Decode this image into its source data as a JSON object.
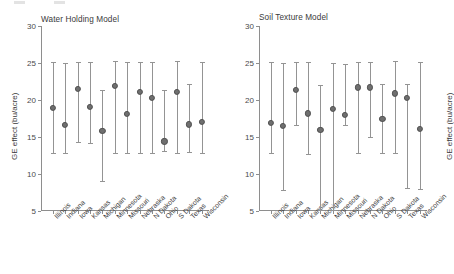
{
  "figure": {
    "panels": [
      {
        "id": "water-holding",
        "title": "Water Holding Model",
        "ylabel": "GE effect (bu/acre)"
      },
      {
        "id": "soil-texture",
        "title": "Soil Texture Model",
        "ylabel": "GE effect (bu/acre)"
      }
    ]
  },
  "chart_data": [
    {
      "type": "scatter",
      "title": "Water Holding Model",
      "xlabel": "",
      "ylabel": "GE effect (bu/acre)",
      "ylim": [
        5,
        30
      ],
      "yticks": [
        30,
        25,
        20,
        15,
        10,
        5
      ],
      "grid": false,
      "legend": "none",
      "categories": [
        "Illinois",
        "Indiana",
        "Iowa",
        "Kansas",
        "Michigan",
        "Minnesota",
        "Missouri",
        "Nebraska",
        "N Dakota",
        "Ohio",
        "S Dakota",
        "Texas",
        "Wisconsin"
      ],
      "values": [
        18.9,
        16.6,
        21.5,
        19.1,
        15.8,
        21.9,
        18.1,
        21.1,
        20.3,
        14.4,
        21.1,
        16.7,
        17.0
      ],
      "ci_lower": [
        12.8,
        12.8,
        14.3,
        14.2,
        9.1,
        12.8,
        12.8,
        12.8,
        12.9,
        13.1,
        12.9,
        13.0,
        12.8
      ],
      "ci_upper": [
        25.1,
        25.0,
        25.2,
        25.1,
        21.3,
        25.3,
        25.1,
        25.2,
        25.1,
        21.3,
        25.3,
        22.2,
        25.2
      ]
    },
    {
      "type": "scatter",
      "title": "Soil Texture Model",
      "xlabel": "",
      "ylabel": "GE effect (bu/acre)",
      "ylim": [
        5,
        30
      ],
      "yticks": [
        30,
        25,
        20,
        15,
        10,
        5
      ],
      "grid": false,
      "legend": "none",
      "categories": [
        "Illinois",
        "Indiana",
        "Iowa",
        "Kansas",
        "Michigan",
        "Minnesota",
        "Missouri",
        "Nebraska",
        "N Dakota",
        "Ohio",
        "S Dakota",
        "Texas",
        "Wisconsin"
      ],
      "values": [
        16.9,
        16.5,
        21.4,
        18.2,
        16.0,
        18.8,
        18.0,
        21.7,
        21.7,
        17.5,
        20.9,
        20.3,
        16.1
      ],
      "ci_lower": [
        12.9,
        7.8,
        16.6,
        12.7,
        5.1,
        5.1,
        16.6,
        12.9,
        15.0,
        12.8,
        12.9,
        8.1,
        8.0
      ],
      "ci_upper": [
        25.1,
        25.0,
        25.2,
        25.2,
        22.0,
        25.0,
        24.8,
        25.2,
        25.2,
        22.2,
        25.3,
        22.2,
        25.1
      ]
    }
  ]
}
